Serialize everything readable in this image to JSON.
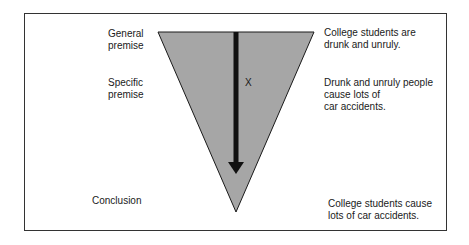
{
  "diagram": {
    "colors": {
      "triangle_fill": "#a6a6a6",
      "triangle_stroke": "#1a1a1a",
      "arrow": "#111111",
      "frame": "#333333"
    },
    "left_labels": {
      "general": "General\npremise",
      "specific": "Specific\npremise",
      "conclusion": "Conclusion"
    },
    "center_marker": "X",
    "right_statements": {
      "general": "College students are\ndrunk and unruly.",
      "specific": "Drunk and unruly people\ncause lots of\ncar accidents.",
      "conclusion": "College students cause\nlots of car accidents."
    }
  }
}
